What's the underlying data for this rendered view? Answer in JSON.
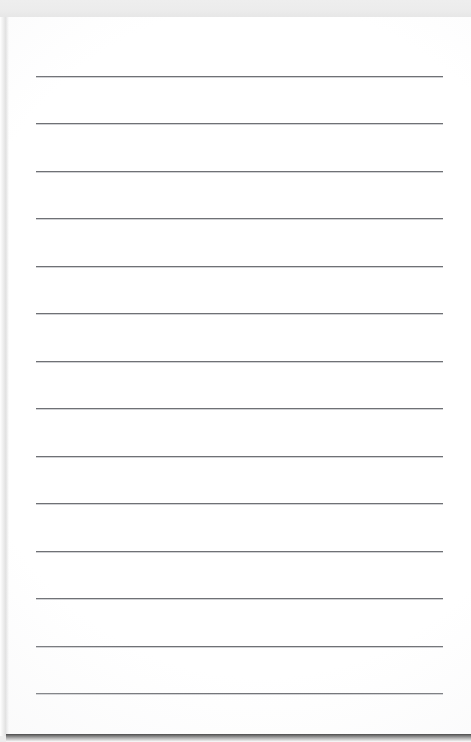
{
  "document": {
    "kind": "scanned-lined-paper",
    "title": "Blank ruled notebook page",
    "content_text": "",
    "page_background_color": "#ffffff",
    "scan_background_color": "#ececec",
    "rule_color": "#6f7175",
    "shadow_color": "#3a3a3a"
  },
  "canvas": {
    "width": 471,
    "height": 742
  },
  "sheet": {
    "left": 6,
    "top": 17,
    "width": 465,
    "height": 719
  },
  "ruling": {
    "line_count": 13,
    "line_start_x": 36,
    "line_end_x": 443,
    "line_length": 407,
    "line_thickness": 1,
    "line_spacing": 47.4,
    "first_line_y": 76,
    "last_line_y": 693,
    "line_y_positions": [
      76,
      123,
      171,
      218,
      266,
      313,
      361,
      408,
      456,
      503,
      551,
      598,
      646,
      693
    ]
  },
  "lines": [
    {
      "index": 1,
      "y": 76,
      "text": ""
    },
    {
      "index": 2,
      "y": 123,
      "text": ""
    },
    {
      "index": 3,
      "y": 171,
      "text": ""
    },
    {
      "index": 4,
      "y": 218,
      "text": ""
    },
    {
      "index": 5,
      "y": 266,
      "text": ""
    },
    {
      "index": 6,
      "y": 313,
      "text": ""
    },
    {
      "index": 7,
      "y": 361,
      "text": ""
    },
    {
      "index": 8,
      "y": 408,
      "text": ""
    },
    {
      "index": 9,
      "y": 456,
      "text": ""
    },
    {
      "index": 10,
      "y": 503,
      "text": ""
    },
    {
      "index": 11,
      "y": 551,
      "text": ""
    },
    {
      "index": 12,
      "y": 598,
      "text": ""
    },
    {
      "index": 13,
      "y": 646,
      "text": ""
    },
    {
      "index": 14,
      "y": 693,
      "text": ""
    }
  ]
}
